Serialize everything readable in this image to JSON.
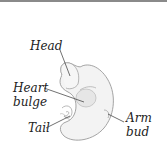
{
  "diagram": {
    "labels": {
      "head": "Head",
      "heart_bulge_line1": "Heart",
      "heart_bulge_line2": "bulge",
      "tail": "Tail",
      "arm_bud_line1": "Arm",
      "arm_bud_line2": "bud"
    },
    "colors": {
      "outline": "#9a9a9a",
      "fill": "#f2f2f2",
      "leader": "#333333",
      "text": "#222222",
      "top_rule": "#8a8a8a"
    }
  }
}
